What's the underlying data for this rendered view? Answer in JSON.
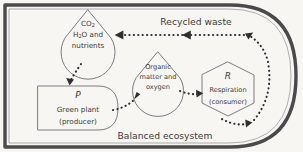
{
  "diagram": {
    "title": "Balanced ecosystem",
    "caption": "Balanced ecosystem",
    "nodes": {
      "inorganic_pool": {
        "shape": "droplet",
        "line1": "CO",
        "line1_sub": "2",
        "line2a": "H",
        "line2_sub": "2",
        "line2b": "O and",
        "line3": "nutrients"
      },
      "producer": {
        "shape": "rounded-right-box",
        "symbol": "P",
        "line1": "Green plant",
        "line2": "(producer)"
      },
      "organic_pool": {
        "shape": "droplet",
        "line1": "Organic",
        "line2": "matter and",
        "line3": "oxygen"
      },
      "consumer": {
        "shape": "hexagon",
        "symbol": "R",
        "line1": "Respiration",
        "line2": "(consumer)"
      }
    },
    "edges": {
      "recycled_waste_label": "Recycled waste",
      "flows": [
        "inorganic-pool-to-producer",
        "producer-to-organic-pool",
        "organic-pool-to-consumer",
        "consumer-to-recycled-waste",
        "recycled-waste-to-inorganic-pool"
      ]
    },
    "colors": {
      "background": "#f7f6f3",
      "ink": "#3a3a3c",
      "outline": "#6d6d70",
      "dotted_flow": "#2f2f31",
      "frame": "#4a4a4c"
    }
  }
}
